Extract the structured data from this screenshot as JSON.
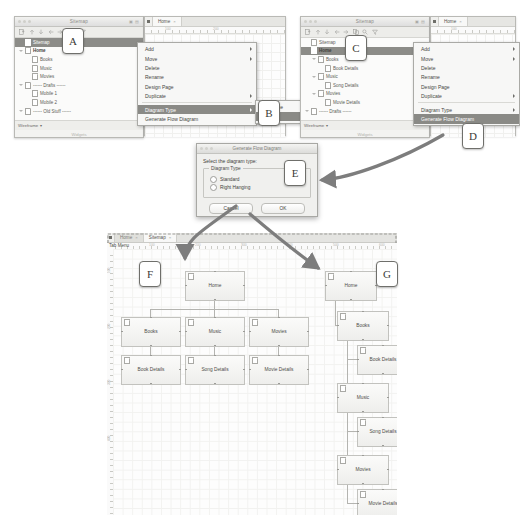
{
  "colors": {
    "selection": "#8c8c88",
    "menu_highlight": "#8a8a86",
    "node_fill": "#f4f4f2",
    "node_border": "#c2c2be",
    "arrow": "#808080",
    "badge_border": "#6f6f6b"
  },
  "panel_left": {
    "window_title": "Sitemap",
    "toolbar_icons": [
      "add-page-icon",
      "move-up-icon",
      "move-down-icon",
      "indent-left-icon",
      "indent-right-icon",
      "search-icon",
      "filter-icon"
    ],
    "tree": [
      {
        "label": "Sitemap",
        "indent": 0,
        "twist": "none",
        "selected": true,
        "bold": false
      },
      {
        "label": "Home",
        "indent": 0,
        "twist": "open",
        "selected": false,
        "bold": true
      },
      {
        "label": "Books",
        "indent": 1,
        "twist": "none",
        "selected": false,
        "bold": false
      },
      {
        "label": "Music",
        "indent": 1,
        "twist": "none",
        "selected": false,
        "bold": false
      },
      {
        "label": "Movies",
        "indent": 1,
        "twist": "none",
        "selected": false,
        "bold": false
      },
      {
        "label": "------ Drafts ------",
        "indent": 0,
        "twist": "open",
        "selected": false,
        "bold": false
      },
      {
        "label": "Mobile 1",
        "indent": 1,
        "twist": "none",
        "selected": false,
        "bold": false
      },
      {
        "label": "Mobile 2",
        "indent": 1,
        "twist": "none",
        "selected": false,
        "bold": false
      },
      {
        "label": "------ Old Stuff ------",
        "indent": 0,
        "twist": "open",
        "selected": false,
        "bold": false
      }
    ],
    "widgets_label": "Widgets",
    "footer_dropdown": "Wireframe",
    "editor_tab": "Home",
    "ruler_ticks": [
      "100",
      "200"
    ]
  },
  "panel_right": {
    "window_title": "Sitemap",
    "toolbar_icons": [
      "add-page-icon",
      "move-up-icon",
      "move-down-icon",
      "indent-left-icon",
      "indent-right-icon",
      "duplicate-icon",
      "search-icon",
      "filter-icon"
    ],
    "tree": [
      {
        "label": "Sitemap",
        "indent": 0,
        "twist": "none",
        "selected": false,
        "bold": false
      },
      {
        "label": "Home",
        "indent": 0,
        "twist": "none",
        "selected": true,
        "bold": true
      },
      {
        "label": "Books",
        "indent": 1,
        "twist": "open",
        "selected": false,
        "bold": false
      },
      {
        "label": "Book Details",
        "indent": 2,
        "twist": "none",
        "selected": false,
        "bold": false
      },
      {
        "label": "Music",
        "indent": 1,
        "twist": "open",
        "selected": false,
        "bold": false
      },
      {
        "label": "Song Details",
        "indent": 2,
        "twist": "none",
        "selected": false,
        "bold": false
      },
      {
        "label": "Movies",
        "indent": 1,
        "twist": "open",
        "selected": false,
        "bold": false
      },
      {
        "label": "Movie Details",
        "indent": 2,
        "twist": "none",
        "selected": false,
        "bold": false
      },
      {
        "label": "------ Drafts ------",
        "indent": 0,
        "twist": "open",
        "selected": false,
        "bold": false
      }
    ],
    "widgets_label": "Widgets",
    "footer_dropdown": "Wireframe",
    "editor_tab": "Home",
    "ruler_ticks": [
      "100"
    ]
  },
  "context_menu": {
    "items": [
      {
        "label": "Add",
        "submenu": true,
        "highlighted": false
      },
      {
        "label": "Move",
        "submenu": true,
        "highlighted": false
      },
      {
        "label": "Delete",
        "submenu": false,
        "highlighted": false
      },
      {
        "label": "Rename",
        "submenu": false,
        "highlighted": false
      },
      {
        "label": "Design Page",
        "submenu": false,
        "highlighted": false
      },
      {
        "label": "Duplicate",
        "submenu": true,
        "highlighted": false
      },
      {
        "label": "Diagram Type",
        "submenu": true,
        "highlighted": true
      },
      {
        "label": "Generate Flow Diagram",
        "submenu": false,
        "highlighted": false
      }
    ],
    "submenu": {
      "items": [
        {
          "label": "Wireframe",
          "highlighted": false
        },
        {
          "label": "Flow",
          "highlighted": true
        }
      ]
    }
  },
  "context_menu_right": {
    "items": [
      {
        "label": "Add",
        "submenu": true,
        "highlighted": false
      },
      {
        "label": "Move",
        "submenu": true,
        "highlighted": false
      },
      {
        "label": "Delete",
        "submenu": false,
        "highlighted": false
      },
      {
        "label": "Rename",
        "submenu": false,
        "highlighted": false
      },
      {
        "label": "Design Page",
        "submenu": false,
        "highlighted": false
      },
      {
        "label": "Duplicate",
        "submenu": true,
        "highlighted": false
      },
      {
        "label": "Diagram Type",
        "submenu": true,
        "highlighted": false
      },
      {
        "label": "Generate Flow Diagram",
        "submenu": false,
        "highlighted": true
      }
    ]
  },
  "dialog": {
    "title": "Generate Flow Diagram",
    "prompt": "Select the diagram type:",
    "fieldset_legend": "Diagram Type",
    "options": [
      {
        "label": "Standard",
        "selected": true
      },
      {
        "label": "Right Hanging",
        "selected": false
      }
    ],
    "cancel_label": "Cancel",
    "ok_label": "OK"
  },
  "main_window": {
    "tabs": [
      {
        "label": "Home",
        "active": false
      },
      {
        "label": "Sitemap",
        "active": true
      }
    ],
    "tab_menu_label": "Tab Menu",
    "ruler_ticks": [
      "100",
      "200",
      "300",
      "400",
      "500",
      "600"
    ],
    "vruler_ticks": [
      "100",
      "200",
      "300",
      "400"
    ],
    "standard_diagram": {
      "nodes": [
        {
          "label": "Home",
          "x": 72,
          "y": 22,
          "w": 58,
          "h": 28
        },
        {
          "label": "Books",
          "x": 8,
          "y": 68,
          "w": 58,
          "h": 28
        },
        {
          "label": "Music",
          "x": 72,
          "y": 68,
          "w": 58,
          "h": 28
        },
        {
          "label": "Movies",
          "x": 136,
          "y": 68,
          "w": 58,
          "h": 28
        },
        {
          "label": "Book Details",
          "x": 8,
          "y": 106,
          "w": 58,
          "h": 28
        },
        {
          "label": "Song Details",
          "x": 72,
          "y": 106,
          "w": 58,
          "h": 28
        },
        {
          "label": "Movie Details",
          "x": 136,
          "y": 106,
          "w": 58,
          "h": 28
        }
      ]
    },
    "right_hanging_diagram": {
      "nodes": [
        {
          "label": "Home",
          "x": 212,
          "y": 22,
          "w": 50,
          "h": 28
        },
        {
          "label": "Books",
          "x": 224,
          "y": 62,
          "w": 50,
          "h": 28
        },
        {
          "label": "Book Details",
          "x": 244,
          "y": 96,
          "w": 50,
          "h": 28
        },
        {
          "label": "Music",
          "x": 224,
          "y": 134,
          "w": 50,
          "h": 28
        },
        {
          "label": "Song Details",
          "x": 244,
          "y": 168,
          "w": 50,
          "h": 28
        },
        {
          "label": "Movies",
          "x": 224,
          "y": 206,
          "w": 50,
          "h": 28
        },
        {
          "label": "Movie Details",
          "x": 244,
          "y": 240,
          "w": 50,
          "h": 28
        }
      ]
    }
  },
  "badges": [
    {
      "letter": "A",
      "x": 62,
      "y": 28
    },
    {
      "letter": "B",
      "x": 258,
      "y": 100
    },
    {
      "letter": "C",
      "x": 345,
      "y": 35
    },
    {
      "letter": "D",
      "x": 462,
      "y": 123
    },
    {
      "letter": "E",
      "x": 284,
      "y": 160
    },
    {
      "letter": "F",
      "x": 139,
      "y": 261
    },
    {
      "letter": "G",
      "x": 376,
      "y": 261
    }
  ]
}
